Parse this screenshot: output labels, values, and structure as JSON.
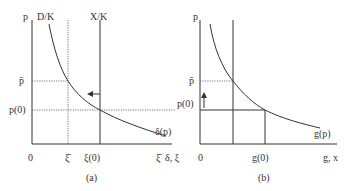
{
  "panel_a": {
    "caption": "(a)",
    "y_axis_label": "p",
    "x_axis_label": "δ, ξ",
    "origin_label": "0",
    "curve_top_label": "D/K",
    "vertical_line_label": "X/K",
    "curve_label": "δ(p)",
    "p_bar_label": "p̄",
    "p0_label": "p(0)",
    "xi_bar_label": "ξ̄",
    "xi0_label": "ξ(0)",
    "xi_bar_end_label": "ξ̄",
    "arrow_direction": "left"
  },
  "panel_b": {
    "caption": "(b)",
    "y_axis_label": "p",
    "x_axis_label": "g, x",
    "origin_label": "0",
    "curve_label": "g(p)",
    "p_bar_label": "p̄",
    "p0_label": "p(0)",
    "g0_label": "g(0)",
    "arrow_direction": "up"
  },
  "colors": {
    "ink": "#333333",
    "background": "#ffffff"
  }
}
